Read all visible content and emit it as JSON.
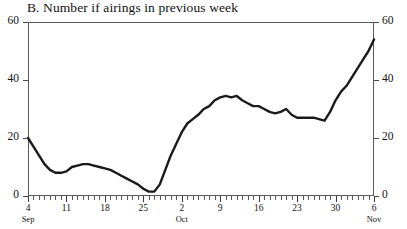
{
  "chart_data": {
    "type": "line",
    "title": "B. Number if airings in previous week",
    "xlabel": "",
    "ylabel": "",
    "ylim": [
      0,
      60
    ],
    "yticks": [
      0,
      20,
      40,
      60
    ],
    "y_axis_mirrored": true,
    "grid": false,
    "legend": null,
    "x_tick_labels": [
      {
        "day": "4",
        "month": "Sep"
      },
      {
        "day": "11",
        "month": ""
      },
      {
        "day": "18",
        "month": ""
      },
      {
        "day": "25",
        "month": ""
      },
      {
        "day": "2",
        "month": "Oct"
      },
      {
        "day": "9",
        "month": ""
      },
      {
        "day": "16",
        "month": ""
      },
      {
        "day": "23",
        "month": ""
      },
      {
        "day": "30",
        "month": ""
      },
      {
        "day": "6",
        "month": "Nov"
      }
    ],
    "x": [
      "Sep 4",
      "Sep 5",
      "Sep 6",
      "Sep 7",
      "Sep 8",
      "Sep 9",
      "Sep 10",
      "Sep 11",
      "Sep 12",
      "Sep 13",
      "Sep 14",
      "Sep 15",
      "Sep 16",
      "Sep 17",
      "Sep 18",
      "Sep 19",
      "Sep 20",
      "Sep 21",
      "Sep 22",
      "Sep 23",
      "Sep 24",
      "Sep 25",
      "Sep 26",
      "Sep 27",
      "Sep 28",
      "Sep 29",
      "Sep 30",
      "Oct 1",
      "Oct 2",
      "Oct 3",
      "Oct 4",
      "Oct 5",
      "Oct 6",
      "Oct 7",
      "Oct 8",
      "Oct 9",
      "Oct 10",
      "Oct 11",
      "Oct 12",
      "Oct 13",
      "Oct 14",
      "Oct 15",
      "Oct 16",
      "Oct 17",
      "Oct 18",
      "Oct 19",
      "Oct 20",
      "Oct 21",
      "Oct 22",
      "Oct 23",
      "Oct 24",
      "Oct 25",
      "Oct 26",
      "Oct 27",
      "Oct 28",
      "Oct 29",
      "Oct 30",
      "Oct 31",
      "Nov 1",
      "Nov 2",
      "Nov 3",
      "Nov 4",
      "Nov 5",
      "Nov 6"
    ],
    "values": [
      20,
      17,
      14,
      11,
      9,
      8,
      8,
      8.5,
      10,
      10.5,
      11,
      11,
      10.5,
      10,
      9.5,
      9,
      8,
      7,
      6,
      5,
      4,
      2.5,
      1.5,
      1.5,
      4,
      9,
      14,
      18,
      22,
      25,
      26.5,
      28,
      30,
      31,
      33,
      34,
      34.5,
      34,
      34.5,
      33,
      32,
      31,
      31,
      30,
      29,
      28.5,
      29,
      30,
      28,
      27,
      27,
      27,
      27,
      26.5,
      26,
      29,
      33,
      36,
      38,
      41,
      44,
      47,
      50,
      54
    ],
    "series_color": "#1a1a1a",
    "line_width": 2.4
  }
}
